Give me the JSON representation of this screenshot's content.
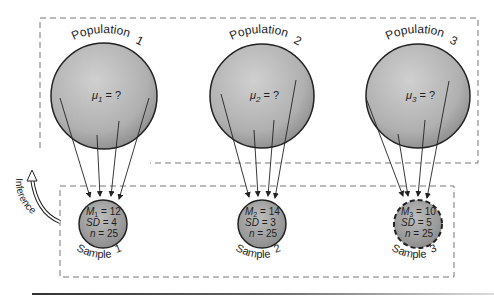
{
  "colors": {
    "circle_fill_light": "#c9c9c9",
    "circle_fill_dark": "#8f8f8f",
    "stroke": "#222222",
    "dashed_box": "#777777",
    "background": "#ffffff"
  },
  "populations": [
    {
      "label": "Population",
      "index": "1",
      "mu_symbol": "μ",
      "sub": "1",
      "value_text": " = ?"
    },
    {
      "label": "Population",
      "index": "2",
      "mu_symbol": "μ",
      "sub": "2",
      "value_text": " = ?"
    },
    {
      "label": "Population",
      "index": "3",
      "mu_symbol": "μ",
      "sub": "3",
      "value_text": " = ?"
    }
  ],
  "samples": [
    {
      "label": "Sample",
      "index": "1",
      "m_symbol": "M",
      "sub": "1",
      "m_value": " = 12",
      "sd_label": "SD",
      "sd_value": " = 4",
      "n_label": "n",
      "n_value": " = 25",
      "dashed": false
    },
    {
      "label": "Sample",
      "index": "2",
      "m_symbol": "M",
      "sub": "2",
      "m_value": " = 14",
      "sd_label": "SD",
      "sd_value": " = 3",
      "n_label": "n",
      "n_value": " = 25",
      "dashed": false
    },
    {
      "label": "Sample",
      "index": "3",
      "m_symbol": "M",
      "sub": "3",
      "m_value": " = 10",
      "sd_label": "SD",
      "sd_value": " = 5",
      "n_label": "n",
      "n_value": " = 25",
      "dashed": true
    }
  ],
  "inference": {
    "label": "Inference"
  }
}
